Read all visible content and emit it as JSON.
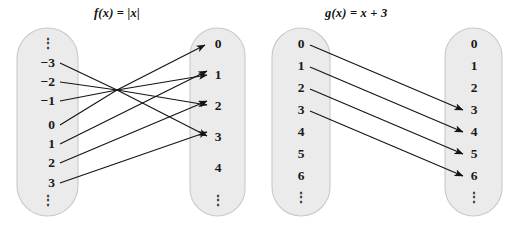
{
  "figure": {
    "background_color": "#ffffff",
    "oval_fill": "#ebebeb",
    "oval_stroke": "#c9c9c9",
    "arrow_color": "#141414",
    "vertical_dots": "⋮"
  },
  "diagrams": [
    {
      "id": "f-mapping",
      "title": "f(x) = |x|",
      "title_parts": {
        "fn": "f",
        "lparen": "(",
        "var": "x",
        "rparen": ")",
        "eq": " = ",
        "rhs": "|x|"
      },
      "domain": {
        "name": "domain-oval-f",
        "top_ellipsis": true,
        "bottom_ellipsis": true,
        "items": [
          "−3",
          "−2",
          "−1",
          "0",
          "1",
          "2",
          "3"
        ]
      },
      "codomain": {
        "name": "codomain-oval-f",
        "top_ellipsis": false,
        "bottom_ellipsis": true,
        "items": [
          "0",
          "1",
          "2",
          "3",
          "4"
        ]
      },
      "mappings": [
        {
          "from": "−3",
          "to": "3"
        },
        {
          "from": "−2",
          "to": "2"
        },
        {
          "from": "−1",
          "to": "1"
        },
        {
          "from": "0",
          "to": "0"
        },
        {
          "from": "1",
          "to": "1"
        },
        {
          "from": "2",
          "to": "2"
        },
        {
          "from": "3",
          "to": "3"
        }
      ],
      "unmapped_codomain_values": [
        "4"
      ]
    },
    {
      "id": "g-mapping",
      "title": "g(x) = x + 3",
      "title_parts": {
        "fn": "g",
        "lparen": "(",
        "var": "x",
        "rparen": ")",
        "eq": " = ",
        "rhs": "x + 3"
      },
      "domain": {
        "name": "domain-oval-g",
        "top_ellipsis": false,
        "bottom_ellipsis": true,
        "items": [
          "0",
          "1",
          "2",
          "3",
          "4",
          "5",
          "6"
        ]
      },
      "codomain": {
        "name": "codomain-oval-g",
        "top_ellipsis": false,
        "bottom_ellipsis": true,
        "items": [
          "0",
          "1",
          "2",
          "3",
          "4",
          "5",
          "6"
        ]
      },
      "mappings": [
        {
          "from": "0",
          "to": "3"
        },
        {
          "from": "1",
          "to": "4"
        },
        {
          "from": "2",
          "to": "5"
        },
        {
          "from": "3",
          "to": "6"
        }
      ],
      "unmapped_codomain_values": [
        "0",
        "1",
        "2"
      ]
    }
  ]
}
